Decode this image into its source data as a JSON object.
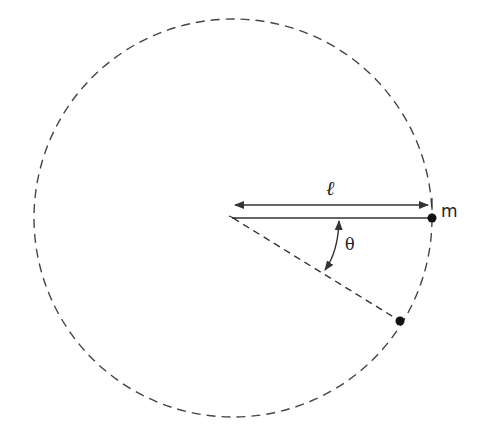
{
  "diagram": {
    "type": "pendulum-circle",
    "labels": {
      "length": "ℓ",
      "mass": "m",
      "angle": "θ"
    },
    "geometry": {
      "center": [
        233,
        218
      ],
      "radius": 200,
      "pivot_to_mass_length_label": "ℓ",
      "angle_label": "θ"
    },
    "colors": {
      "stroke": "#333333",
      "background": "#ffffff"
    }
  }
}
